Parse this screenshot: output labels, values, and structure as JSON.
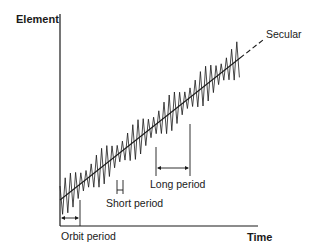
{
  "axes": {
    "y_label": "Element",
    "x_label": "Time"
  },
  "labels": {
    "secular": "Secular",
    "short_period": "Short period",
    "long_period": "Long period",
    "orbit_period": "Orbit period"
  },
  "colors": {
    "line": "#1a1a1a",
    "background": "#ffffff"
  }
}
